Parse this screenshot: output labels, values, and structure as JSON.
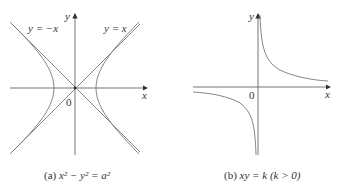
{
  "figure": {
    "panel_a": {
      "caption_prefix": "(a)",
      "caption_equation": "x² − y² = a²",
      "axis_x_label": "x",
      "axis_y_label": "y",
      "origin_label": "0",
      "asymptote_left_label": "y = −x",
      "asymptote_right_label": "y = x",
      "curve": "hyperbola x^2 - y^2 = a^2"
    },
    "panel_b": {
      "caption_prefix": "(b)",
      "caption_equation": "xy = k  (k > 0)",
      "axis_x_label": "x",
      "axis_y_label": "y",
      "origin_label": "0",
      "curve": "rectangular hyperbola xy = k"
    },
    "colors": {
      "axis": "#555555",
      "curve": "#777777",
      "text": "#333333"
    }
  }
}
